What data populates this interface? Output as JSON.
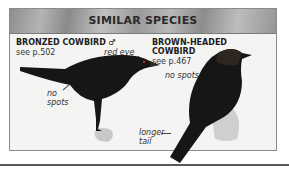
{
  "panel": {
    "title": "SIMILAR SPECIES",
    "species": [
      {
        "name": "BRONZED COWBIRD ♂",
        "ref": "see p.502",
        "notes": [
          "red eye",
          "no",
          "spots"
        ]
      },
      {
        "name_line1": "BROWN-HEADED",
        "name_line2": "COWBIRD",
        "ref": "see p.467",
        "notes": [
          "no spots",
          "longer",
          "tail"
        ]
      }
    ]
  },
  "colors": {
    "bird": "#161616",
    "panel_bg": "#f4f4f3",
    "header": "#a4a4a4"
  }
}
